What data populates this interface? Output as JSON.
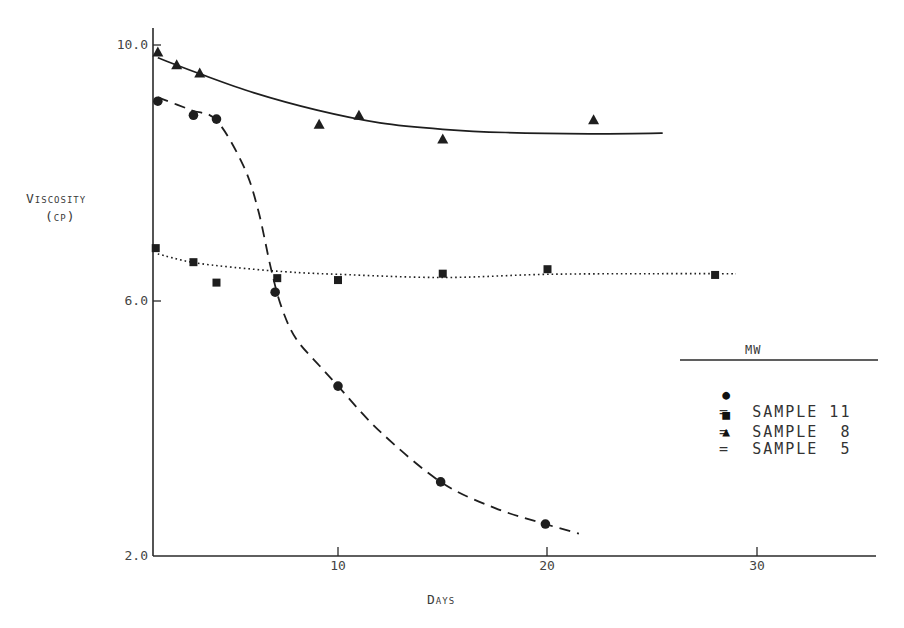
{
  "chart_data": {
    "type": "scatter",
    "title": "",
    "xlabel": "Days",
    "ylabel": "Viscosity (cP)",
    "ylabel_line1": "Viscosity",
    "ylabel_line2": "(cP)",
    "xlim": [
      1.2,
      36
    ],
    "ylim": [
      2.0,
      10.3
    ],
    "x_ticks": [
      10,
      20,
      30
    ],
    "x_tick_labels": [
      "10",
      "20",
      "30"
    ],
    "y_ticks": [
      10.0,
      6.0,
      2.0
    ],
    "y_tick_labels": [
      "10.0",
      "6.0",
      "2.0"
    ],
    "grid": false,
    "legend_position": "right-middle",
    "legend_title": "MW",
    "series": [
      {
        "name": "Sample 11",
        "legend_label": "SAMPLE 11",
        "marker": "circle",
        "line_style": "dashed",
        "x": [
          1.4,
          3.1,
          4.2,
          7.0,
          10.0,
          14.9,
          19.9
        ],
        "y": [
          9.12,
          8.9,
          8.84,
          6.13,
          4.66,
          3.16,
          2.5
        ],
        "fit_curve": [
          [
            1.4,
            9.18
          ],
          [
            3.0,
            8.98
          ],
          [
            4.2,
            8.82
          ],
          [
            5.5,
            8.1
          ],
          [
            6.2,
            7.4
          ],
          [
            6.8,
            6.5
          ],
          [
            7.3,
            5.9
          ],
          [
            8.0,
            5.4
          ],
          [
            9.2,
            4.95
          ],
          [
            10.0,
            4.66
          ],
          [
            12.0,
            3.95
          ],
          [
            14.9,
            3.16
          ],
          [
            17.5,
            2.75
          ],
          [
            19.9,
            2.5
          ],
          [
            21.5,
            2.35
          ]
        ]
      },
      {
        "name": "Sample 8",
        "legend_label": "SAMPLE 8",
        "marker": "square",
        "line_style": "dotted",
        "x": [
          1.3,
          3.1,
          4.2,
          7.1,
          10.0,
          15.0,
          20.0,
          28.0
        ],
        "y": [
          6.82,
          6.6,
          6.28,
          6.35,
          6.32,
          6.42,
          6.49,
          6.4
        ],
        "fit_curve": [
          [
            1.4,
            6.73
          ],
          [
            3.0,
            6.6
          ],
          [
            5.0,
            6.52
          ],
          [
            7.5,
            6.45
          ],
          [
            10.0,
            6.41
          ],
          [
            15.0,
            6.36
          ],
          [
            20.0,
            6.41
          ],
          [
            25.0,
            6.42
          ],
          [
            29.0,
            6.42
          ]
        ]
      },
      {
        "name": "Sample 5",
        "legend_label": "SAMPLE 5",
        "marker": "triangle",
        "line_style": "solid",
        "x": [
          1.4,
          2.3,
          3.4,
          9.1,
          11.0,
          15.0,
          22.2
        ],
        "y": [
          9.89,
          9.69,
          9.56,
          8.76,
          8.9,
          8.53,
          8.83
        ],
        "fit_curve": [
          [
            1.4,
            9.8
          ],
          [
            3.4,
            9.55
          ],
          [
            6.0,
            9.25
          ],
          [
            9.0,
            8.98
          ],
          [
            12.0,
            8.78
          ],
          [
            15.0,
            8.68
          ],
          [
            18.0,
            8.63
          ],
          [
            22.0,
            8.61
          ],
          [
            25.5,
            8.62
          ]
        ]
      }
    ]
  },
  "legend": {
    "title": "MW",
    "rows": [
      {
        "symbol": "●",
        "text": "=  SAMPLE 11"
      },
      {
        "symbol": "■",
        "text": "=  SAMPLE  8"
      },
      {
        "symbol": "▲",
        "text": "=  SAMPLE  5"
      }
    ]
  },
  "axes": {
    "y_label_1": "Viscosity",
    "y_label_2": "(cp)",
    "x_label": "Days",
    "y_ticks": [
      "10.0",
      "6.0",
      "2.0"
    ],
    "x_ticks": [
      "10",
      "20",
      "30"
    ]
  },
  "colors": {
    "ink": "#1e1e1e",
    "background": "#ffffff"
  }
}
